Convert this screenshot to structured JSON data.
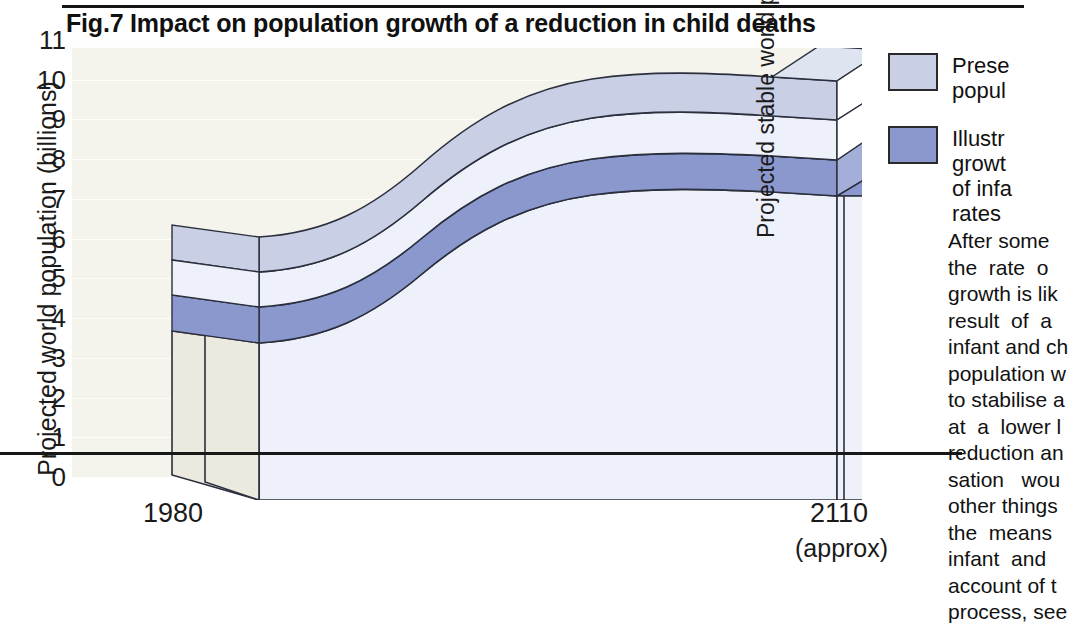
{
  "figure": {
    "title": "Fig.7  Impact on population growth of a reduction in child deaths"
  },
  "axes": {
    "y": {
      "label": "Projected world population (billions)",
      "ticks": [
        "11",
        "10",
        "9",
        "8",
        "7",
        "6",
        "5",
        "4",
        "3",
        "2",
        "1",
        "0"
      ],
      "min": 0,
      "max": 11
    },
    "x": {
      "tick_start": "1980",
      "tick_end": "2110",
      "tick_end_note": "(approx)"
    }
  },
  "annotations": {
    "stable_population": "Projected stable world population"
  },
  "legend": {
    "items": [
      {
        "swatch_color": "#c9d0e6",
        "label": "Prese\npopul"
      },
      {
        "swatch_color": "#8b98cd",
        "label": "Illustr\ngrowt\nof infa\nrates"
      }
    ]
  },
  "sidenote": {
    "text": "After some\nthe  rate  o\ngrowth is lik\nresult  of  a\ninfant and ch\npopulation w\nto stabilise a\nat  a  lower l\nreduction an\nsation   wou\nother things\nthe  means\ninfant  and  \naccount of t\nprocess, see"
  },
  "colors": {
    "grid_background": "#f4f3ec",
    "gridline": "#fdfdfa",
    "front_face": "#eef1f9",
    "side_face": "#eceade",
    "band_light": "#c9d0e6",
    "band_dark": "#8b98cd",
    "band_top_pale": "#dfe4f1",
    "outline": "#2b2f3d",
    "axis": "#181818"
  },
  "chart_data": {
    "type": "area",
    "title": "Fig.7  Impact on population growth of a reduction in child deaths",
    "xlabel": "",
    "ylabel": "Projected world population (billions)",
    "ylim": [
      0,
      11
    ],
    "xlim": [
      "1980",
      "2110"
    ],
    "grid": true,
    "legend_position": "right",
    "x": [
      "1980",
      "2000",
      "2020",
      "2040",
      "2060",
      "2080",
      "2100",
      "2110"
    ],
    "series": [
      {
        "name": "Present population projection (upper surface)",
        "values": [
          4.6,
          5.3,
          6.7,
          8.2,
          9.6,
          10.4,
          10.7,
          10.7
        ]
      },
      {
        "name": "Illustrative lower growth with reduction of infant and child death rates (upper surface)",
        "values": [
          4.1,
          4.7,
          5.9,
          7.2,
          8.4,
          9.0,
          9.2,
          9.2
        ]
      },
      {
        "name": "Stable population after reduction (solid block top)",
        "values": [
          3.3,
          3.8,
          4.8,
          6.0,
          7.3,
          8.1,
          8.4,
          8.4
        ]
      }
    ],
    "notes": [
      "Projected stable world population",
      "2110 (approx)"
    ]
  }
}
